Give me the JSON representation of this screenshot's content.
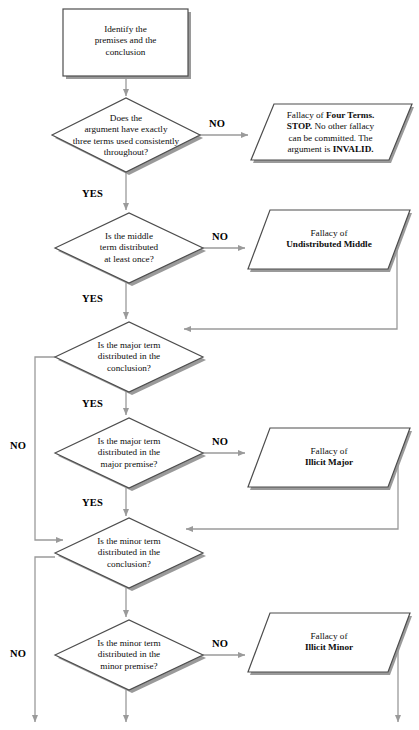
{
  "diagram": {
    "colors": {
      "stroke": "#4d4d4d",
      "shadow": "#808080",
      "fill": "#ffffff",
      "text": "#0d0d0d",
      "arrow": "#8c8c8c"
    }
  },
  "nodes": {
    "start": {
      "type": "process",
      "line1": "Identify the",
      "line2": "premises and the",
      "line3": "conclusion"
    },
    "d1": {
      "type": "decision",
      "line1": "Does the",
      "line2": "argument have exactly",
      "line3": "three terms used consistently",
      "line4": "throughout?"
    },
    "d2": {
      "type": "decision",
      "line1": "Is the middle",
      "line2": "term distributed",
      "line3": "at least once?"
    },
    "d3": {
      "type": "decision",
      "line1": "Is the major term",
      "line2": "distributed in the",
      "line3": "conclusion?"
    },
    "d4": {
      "type": "decision",
      "line1": "Is the major term",
      "line2": "distributed in the",
      "line3": "major premise?"
    },
    "d5": {
      "type": "decision",
      "line1": "Is the minor term",
      "line2": "distributed in the",
      "line3": "conclusion?"
    },
    "d6": {
      "type": "decision",
      "line1": "Is the minor term",
      "line2": "distributed in the",
      "line3": "minor premise?"
    },
    "f1": {
      "type": "output",
      "seg1": "Fallacy of ",
      "seg2": "Four Terms.",
      "seg3": "STOP.",
      "seg4": " No other fallacy",
      "seg5": "can be committed. The",
      "seg6": "argument is ",
      "seg7": "INVALID."
    },
    "f2": {
      "type": "output",
      "line1": "Fallacy of",
      "line2": "Undistributed Middle"
    },
    "f3": {
      "type": "output",
      "line1": "Fallacy of",
      "line2": "Illicit Major"
    },
    "f4": {
      "type": "output",
      "line1": "Fallacy of",
      "line2": "Illicit Minor"
    }
  },
  "edge_labels": {
    "no1": "NO",
    "yes1": "YES",
    "no2": "NO",
    "yes2": "YES",
    "no3": "NO",
    "yes3": "YES",
    "no4": "NO",
    "yes4": "YES",
    "no5": "NO",
    "no6": "NO"
  }
}
